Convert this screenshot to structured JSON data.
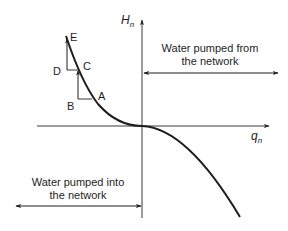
{
  "diagram": {
    "title": "",
    "colors": {
      "ink": "#1e1e1e",
      "axis": "#3a3a3a",
      "background": "#ffffff"
    },
    "axes": {
      "vertical": {
        "symbol": "H",
        "subscript": "n"
      },
      "horizontal": {
        "symbol": "q",
        "subscript": "n"
      }
    },
    "points": {
      "A": "A",
      "B": "B",
      "C": "C",
      "D": "D",
      "E": "E"
    },
    "annotations": {
      "from_network": {
        "line1": "Water pumped from",
        "line2": "the network"
      },
      "into_network": {
        "line1": "Water pumped into",
        "line2": "the network"
      }
    }
  }
}
